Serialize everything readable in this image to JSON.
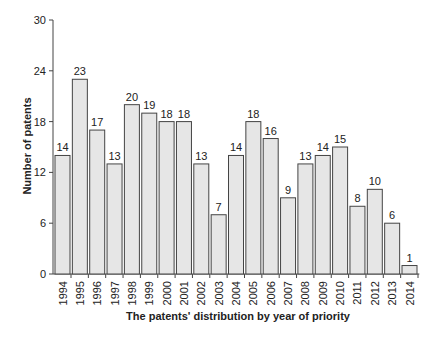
{
  "chart_data": {
    "type": "bar",
    "title": "",
    "xlabel": "The patents' distribution by year of priority",
    "ylabel": "Number of patents",
    "ylim": [
      0,
      30
    ],
    "yticks": [
      0,
      6,
      12,
      18,
      24,
      30
    ],
    "grid": false,
    "legend": null,
    "categories": [
      "1994",
      "1995",
      "1996",
      "1997",
      "1998",
      "1999",
      "2000",
      "2001",
      "2002",
      "2003",
      "2004",
      "2005",
      "2006",
      "2007",
      "2008",
      "2009",
      "2010",
      "2011",
      "2012",
      "2013",
      "2014"
    ],
    "values": [
      14,
      23,
      17,
      13,
      20,
      19,
      18,
      18,
      13,
      7,
      14,
      18,
      16,
      9,
      13,
      14,
      15,
      8,
      10,
      6,
      1
    ],
    "bar_color": "#e6e6e6",
    "bar_edge_color": "#444444"
  }
}
